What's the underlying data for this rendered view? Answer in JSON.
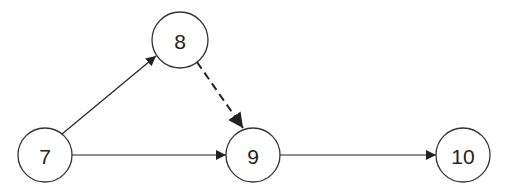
{
  "diagram": {
    "type": "directed-graph",
    "nodes": [
      {
        "id": "7",
        "label": "7",
        "cx": 45,
        "cy": 155,
        "r": 27
      },
      {
        "id": "8",
        "label": "8",
        "cx": 180,
        "cy": 40,
        "r": 28
      },
      {
        "id": "9",
        "label": "9",
        "cx": 253,
        "cy": 155,
        "r": 27
      },
      {
        "id": "10",
        "label": "10",
        "cx": 463,
        "cy": 155,
        "r": 27
      }
    ],
    "edges": [
      {
        "from": "7",
        "to": "8",
        "style": "solid"
      },
      {
        "from": "7",
        "to": "9",
        "style": "solid"
      },
      {
        "from": "8",
        "to": "9",
        "style": "dashed"
      },
      {
        "from": "9",
        "to": "10",
        "style": "solid"
      }
    ],
    "colors": {
      "stroke": "#333333",
      "arrow": "#222222",
      "background": "#ffffff"
    }
  }
}
